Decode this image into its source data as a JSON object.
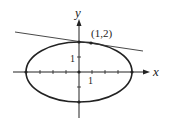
{
  "diagram": {
    "x_axis_label": "x",
    "y_axis_label": "y",
    "x_tick_label": "1",
    "y_tick_label": "1",
    "point_label": "(1,2)",
    "point": [
      1,
      2
    ],
    "ellipse": {
      "center": [
        0,
        0
      ],
      "semi_x_units": 4,
      "semi_y_units": 2
    },
    "colors": {
      "stroke": "#222222",
      "background": "#ffffff"
    }
  }
}
